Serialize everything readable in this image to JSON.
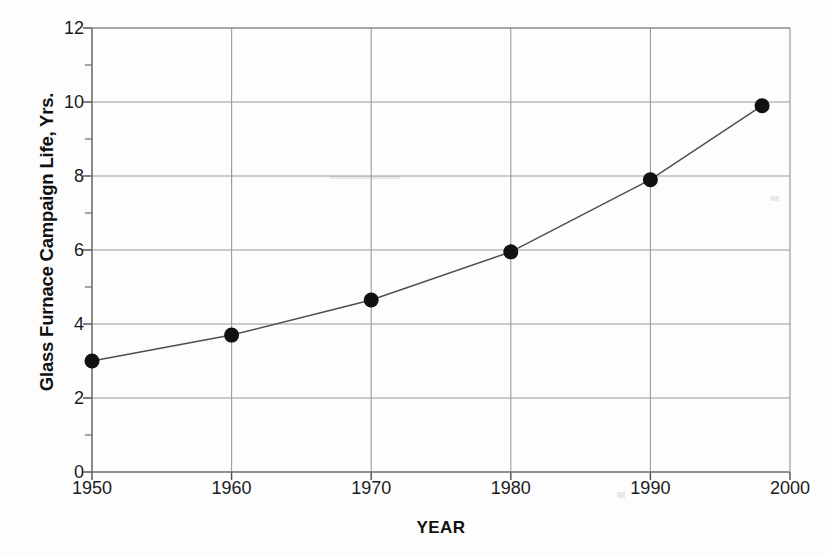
{
  "chart_data": {
    "type": "line",
    "title": "",
    "xlabel": "YEAR",
    "ylabel": "Glass Furnace Campaign Life, Yrs.",
    "xlim": [
      1950,
      2000
    ],
    "ylim": [
      0,
      12
    ],
    "xticks": [
      1950,
      1960,
      1970,
      1980,
      1990,
      2000
    ],
    "xtick_labels": [
      "1950",
      "1960",
      "1970",
      "1980",
      "1990",
      "2000"
    ],
    "yticks": [
      0,
      2,
      4,
      6,
      8,
      10,
      12
    ],
    "ytick_labels": [
      "0",
      "2",
      "4",
      "6",
      "8",
      "10",
      "12"
    ],
    "y_minor_ticks": [
      1,
      3,
      5,
      7,
      9,
      11
    ],
    "grid": "both",
    "legend": "none",
    "marker": "filled-circle",
    "marker_color": "#111111",
    "line_color": "#555555",
    "grid_color": "#9a9a9a",
    "x": [
      1950,
      1960,
      1970,
      1980,
      1990,
      1998
    ],
    "values": [
      3.0,
      3.7,
      4.65,
      5.95,
      7.9,
      9.9
    ],
    "series": [
      {
        "name": "Glass Furnace Campaign Life",
        "points": [
          {
            "x": 1950,
            "y": 3.0
          },
          {
            "x": 1960,
            "y": 3.7
          },
          {
            "x": 1970,
            "y": 4.65
          },
          {
            "x": 1980,
            "y": 5.95
          },
          {
            "x": 1990,
            "y": 7.9
          },
          {
            "x": 1998,
            "y": 9.9
          }
        ]
      }
    ]
  }
}
